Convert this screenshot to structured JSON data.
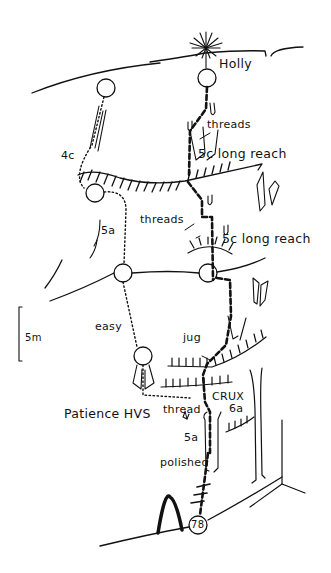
{
  "diagram": {
    "type": "climbing-topo",
    "route_name": "Patience HVS",
    "route_number": "78",
    "scale_label": "5m",
    "labels": {
      "holly": "Holly",
      "threads_top": "threads",
      "grade_5c_1": "5c long reach",
      "threads_mid": "threads",
      "grade_5c_2": "5c long reach",
      "grade_4c": "4c",
      "grade_5a_left": "5a",
      "easy": "easy",
      "jug": "jug",
      "crux": "CRUX",
      "grade_6a": "6a",
      "thread": "thread",
      "grade_5a_low": "5a",
      "polished": "polished",
      "route_name": "Patience HVS",
      "route_number": "78",
      "scale": "5m"
    },
    "legend": {
      "main_line": "thick dashed line = main route",
      "variation_line": "dotted line = variation",
      "belay": "circle = belay",
      "hatched_line": "hatched line = overhang/ledge"
    },
    "colors": {
      "ink": "#111111",
      "background": "#ffffff"
    }
  }
}
